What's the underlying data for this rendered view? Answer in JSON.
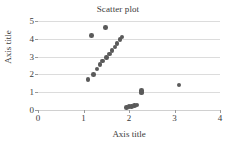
{
  "chart_data": {
    "type": "scatter",
    "title": "Scatter plot",
    "xlabel": "Axis title",
    "ylabel": "Axis title",
    "xlim": [
      0,
      4
    ],
    "ylim": [
      0,
      5
    ],
    "xticks": [
      0,
      1,
      2,
      3,
      4
    ],
    "yticks": [
      0,
      1,
      2,
      3,
      4,
      5
    ],
    "xtick_labels": [
      "0",
      "1",
      "2",
      "3",
      "4"
    ],
    "ytick_labels": [
      "0",
      "1",
      "2",
      "3",
      "4",
      "5"
    ],
    "grid": "horizontal",
    "legend": "none",
    "marker_color": "#5a5a5a",
    "marker_shape": "circle",
    "series": [
      {
        "name": "Series 1",
        "points": [
          [
            1.1,
            1.7
          ],
          [
            1.17,
            4.2
          ],
          [
            1.22,
            2.0
          ],
          [
            1.3,
            2.3
          ],
          [
            1.36,
            2.55
          ],
          [
            1.42,
            2.75
          ],
          [
            1.48,
            4.65
          ],
          [
            1.5,
            2.95
          ],
          [
            1.57,
            3.15
          ],
          [
            1.63,
            3.35
          ],
          [
            1.69,
            3.55
          ],
          [
            1.74,
            3.75
          ],
          [
            1.8,
            3.95
          ],
          [
            1.85,
            4.1
          ],
          [
            1.95,
            0.15
          ],
          [
            2.0,
            0.18
          ],
          [
            2.05,
            0.2
          ],
          [
            2.12,
            0.25
          ],
          [
            2.18,
            0.28
          ],
          [
            2.27,
            0.95
          ],
          [
            2.28,
            1.02
          ],
          [
            2.28,
            1.1
          ],
          [
            3.1,
            1.4
          ]
        ]
      }
    ]
  }
}
